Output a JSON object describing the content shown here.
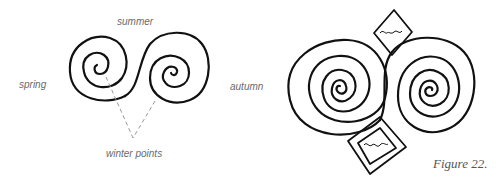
{
  "figure": {
    "caption": "Figure 22.",
    "left_diagram": {
      "labels": {
        "top": "summer",
        "left": "spring",
        "right": "autumn",
        "bottom": "winter points"
      },
      "elements": [
        "double-spiral",
        "dashed-pointer-lines"
      ]
    },
    "right_diagram": {
      "elements": [
        "left-spiral",
        "right-spiral",
        "top-diamond-with-wave",
        "bottom-square-with-wave"
      ]
    }
  },
  "colors": {
    "stroke": "#111111",
    "label": "#6a6a6a",
    "dash": "#9a9a9a",
    "background": "#ffffff"
  }
}
